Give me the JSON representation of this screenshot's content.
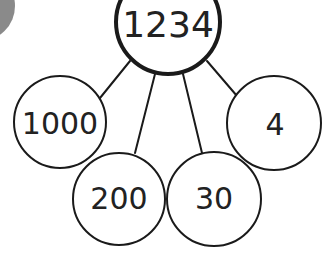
{
  "diagram": {
    "type": "part-whole place value partition",
    "colors": {
      "stroke": "#1a1a1a",
      "text": "#222222",
      "background": "#ffffff",
      "corner_shape": "#8a8a8a"
    },
    "whole": {
      "label": "1234"
    },
    "parts": [
      {
        "label": "1000",
        "place": "thousands"
      },
      {
        "label": "200",
        "place": "hundreds"
      },
      {
        "label": "30",
        "place": "tens"
      },
      {
        "label": "4",
        "place": "ones"
      }
    ]
  }
}
